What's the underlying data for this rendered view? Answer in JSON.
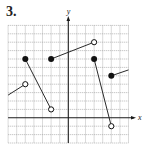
{
  "problem_number": "3.",
  "chart_data": {
    "type": "line",
    "title": "",
    "xlabel": "x",
    "ylabel": "y",
    "xlim": [
      -7,
      7
    ],
    "ylim": [
      -3,
      11
    ],
    "grid": true,
    "grid_step": 1,
    "segments": [
      {
        "from": {
          "x": -7,
          "y": 2.7,
          "marker": "none"
        },
        "to": {
          "x": -5,
          "y": 4,
          "marker": "open"
        }
      },
      {
        "from": {
          "x": -5,
          "y": 7,
          "marker": "filled"
        },
        "to": {
          "x": -2,
          "y": 1,
          "marker": "open"
        }
      },
      {
        "from": {
          "x": -2,
          "y": 7,
          "marker": "filled"
        },
        "to": {
          "x": 3,
          "y": 9,
          "marker": "open"
        }
      },
      {
        "from": {
          "x": 3,
          "y": 7,
          "marker": "filled"
        },
        "to": {
          "x": 5,
          "y": -1,
          "marker": "open"
        }
      },
      {
        "from": {
          "x": 5,
          "y": 5,
          "marker": "filled"
        },
        "to": {
          "x": 7,
          "y": 5.7,
          "marker": "none"
        }
      }
    ],
    "colors": {
      "grid": "#9a9a9a",
      "axis": "#1a1a1a",
      "line": "#2a2a2a",
      "marker": "#111111"
    }
  }
}
